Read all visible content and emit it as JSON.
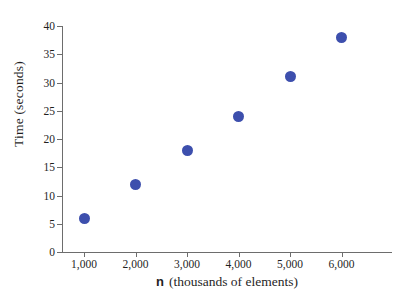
{
  "chart_data": {
    "type": "scatter",
    "title": "",
    "subtitle": "",
    "xlabel_variable": "n",
    "xlabel_units": "(thousands of elements)",
    "xlabel": "n  (thousands of elements)",
    "ylabel": "Time (seconds)",
    "x": [
      1000,
      2000,
      3000,
      4000,
      5000,
      6000
    ],
    "values": [
      6,
      12,
      18,
      24,
      31,
      38
    ],
    "series": [
      {
        "name": "Time",
        "values": [
          6,
          12,
          18,
          24,
          31,
          38
        ]
      }
    ],
    "points": [
      {
        "x": 1000,
        "y": 6
      },
      {
        "x": 2000,
        "y": 12
      },
      {
        "x": 3000,
        "y": 18
      },
      {
        "x": 4000,
        "y": 24
      },
      {
        "x": 5000,
        "y": 31
      },
      {
        "x": 6000,
        "y": 38
      }
    ],
    "xlim": [
      500,
      6500
    ],
    "ylim": [
      0,
      40
    ],
    "xticks": [
      1000,
      2000,
      3000,
      4000,
      5000,
      6000
    ],
    "xtick_labels": [
      "1,000",
      "2,000",
      "3,000",
      "4,000",
      "5,000",
      "6,000"
    ],
    "yticks": [
      0,
      5,
      10,
      15,
      20,
      25,
      30,
      35,
      40
    ],
    "ytick_labels": [
      "0",
      "5",
      "10",
      "15",
      "20",
      "25",
      "30",
      "35",
      "40"
    ],
    "grid": false,
    "legend": false,
    "legend_position": "none",
    "marker_color": "#3d4fad",
    "axis_color": "#6d6d6d",
    "background_color": "#ffffff",
    "annotations": []
  }
}
